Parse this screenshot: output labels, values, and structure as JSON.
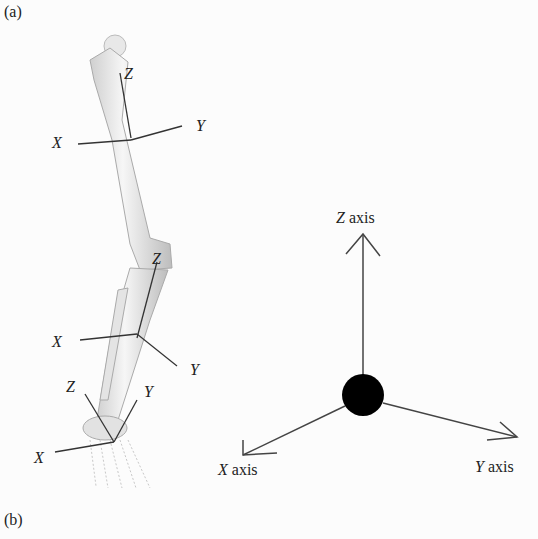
{
  "panel_labels": {
    "a": "(a)",
    "b": "(b)"
  },
  "leg_axes": {
    "femur": {
      "x": "X",
      "y": "Y",
      "z": "Z"
    },
    "knee": {
      "z": "Z"
    },
    "tibia": {
      "x": "X",
      "y": "Y"
    },
    "ankle": {
      "x": "X",
      "y": "Y",
      "z": "Z"
    }
  },
  "reference_frame": {
    "z_var": "Z",
    "z_word": " axis",
    "x_var": "X",
    "x_word": " axis",
    "y_var": "Y",
    "y_word": " axis"
  }
}
